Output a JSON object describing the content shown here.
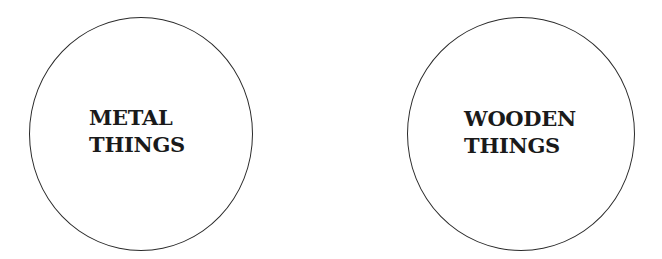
{
  "circles": [
    {
      "line1": "METAL",
      "line2": "THINGS"
    },
    {
      "line1": "WOODEN",
      "line2": "THINGS"
    }
  ]
}
